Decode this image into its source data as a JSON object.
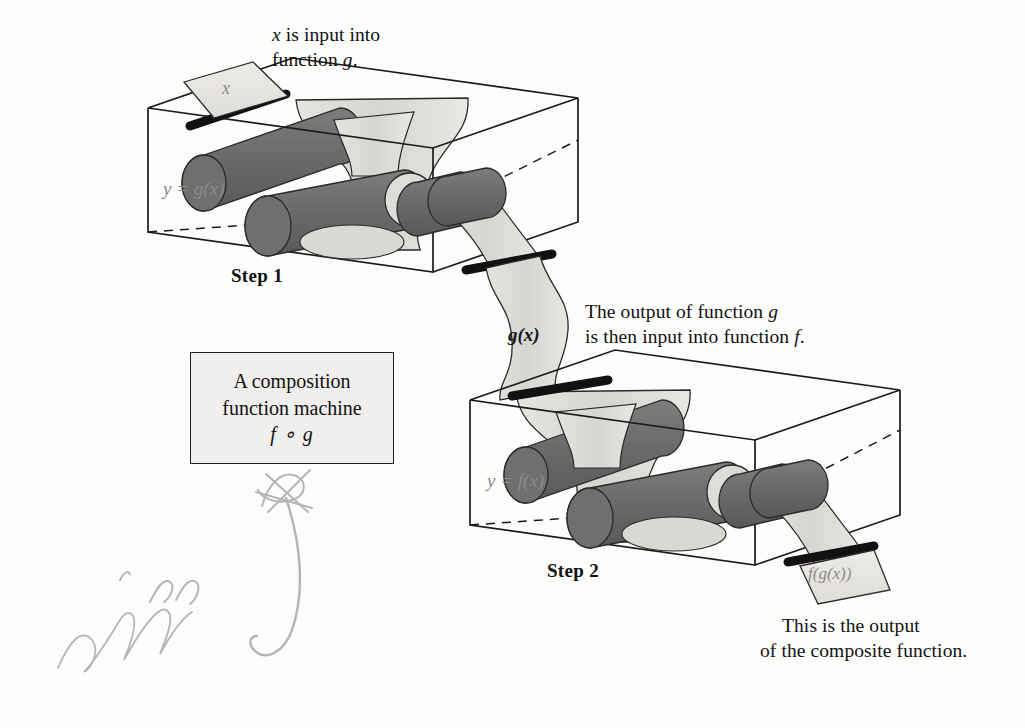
{
  "captions": {
    "top_input_line1": "x is input into",
    "top_input_line2": "function g.",
    "middle_line1": "The output of function g",
    "middle_line2": "is then input into function f.",
    "bottom_line1": "This is the output",
    "bottom_line2": "of the composite function."
  },
  "machine_box": {
    "line1": "A composition",
    "line2": "function machine",
    "line3": "f ∘ g"
  },
  "steps": [
    {
      "label": "Step 1",
      "machine_label": "y = g(x)"
    },
    {
      "label": "Step 2",
      "machine_label": "y = f(x)"
    }
  ],
  "strip_labels": {
    "input": "x",
    "intermediate": "g(x)",
    "output": "f(g(x))"
  },
  "annotation": {
    "kind": "handwritten-pencil-scribble",
    "description": "cursive signature and a large curved arrow"
  },
  "colors": {
    "paper": "#d9d8d4",
    "paper_light": "#eceae6",
    "roller_dark": "#6f6f6f",
    "roller_disc": "#dcdcd8",
    "outline": "#1a1a1a",
    "faint_text": "#8b8b8b",
    "pencil": "#a9a9a9",
    "box_fill": "#f0efed"
  }
}
